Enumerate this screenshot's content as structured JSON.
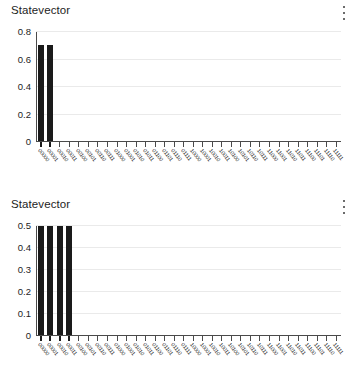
{
  "panels": [
    {
      "title": "Statevector",
      "menu_icon": "kebab-menu-icon",
      "chart_data": {
        "type": "bar",
        "title": "Statevector",
        "xlabel": "",
        "ylabel": "",
        "ylim": [
          0,
          0.8
        ],
        "yticks": [
          0,
          0.2,
          0.4,
          0.6,
          0.8
        ],
        "ytick_labels": [
          "0",
          "0.2",
          "0.4",
          "0.6",
          "0.8"
        ],
        "grid": true,
        "legend": null,
        "categories": [
          "00000",
          "00001",
          "00010",
          "00011",
          "00100",
          "00101",
          "00110",
          "00111",
          "01000",
          "01001",
          "01010",
          "01011",
          "01100",
          "01101",
          "01110",
          "01111",
          "10000",
          "10001",
          "10010",
          "10011",
          "10100",
          "10101",
          "10110",
          "10111",
          "11000",
          "11001",
          "11010",
          "11011",
          "11100",
          "11101",
          "11110",
          "11111"
        ],
        "values": [
          0.707,
          0.707,
          0,
          0,
          0,
          0,
          0,
          0,
          0,
          0,
          0,
          0,
          0,
          0,
          0,
          0,
          0,
          0,
          0,
          0,
          0,
          0,
          0,
          0,
          0,
          0,
          0,
          0,
          0,
          0,
          0,
          0
        ],
        "bar_color": "#1a1a1a"
      }
    },
    {
      "title": "Statevector",
      "menu_icon": "kebab-menu-icon",
      "chart_data": {
        "type": "bar",
        "title": "Statevector",
        "xlabel": "",
        "ylabel": "",
        "ylim": [
          0,
          0.5
        ],
        "yticks": [
          0,
          0.1,
          0.2,
          0.3,
          0.4,
          0.5
        ],
        "ytick_labels": [
          "0",
          "0.1",
          "0.2",
          "0.3",
          "0.4",
          "0.5"
        ],
        "grid": true,
        "legend": null,
        "categories": [
          "00000",
          "00001",
          "00010",
          "00011",
          "00100",
          "00101",
          "00110",
          "00111",
          "01000",
          "01001",
          "01010",
          "01011",
          "01100",
          "01101",
          "01110",
          "01111",
          "10000",
          "10001",
          "10010",
          "10011",
          "10100",
          "10101",
          "10110",
          "10111",
          "11000",
          "11001",
          "11010",
          "11011",
          "11100",
          "11101",
          "11110",
          "11111"
        ],
        "values": [
          0.5,
          0.5,
          0.5,
          0.5,
          0,
          0,
          0,
          0,
          0,
          0,
          0,
          0,
          0,
          0,
          0,
          0,
          0,
          0,
          0,
          0,
          0,
          0,
          0,
          0,
          0,
          0,
          0,
          0,
          0,
          0,
          0,
          0
        ],
        "bar_color": "#1a1a1a"
      }
    }
  ]
}
